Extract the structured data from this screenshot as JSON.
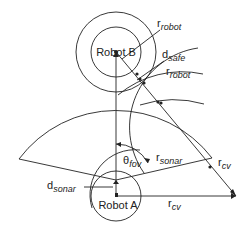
{
  "diagram": {
    "robots": {
      "a": {
        "label": "Robot A"
      },
      "b": {
        "label": "Robot B"
      }
    },
    "labels": {
      "r_robot_top": {
        "main": "r",
        "sub": "robot"
      },
      "d_safe": {
        "main": "d",
        "sub": "safe"
      },
      "r_robot_mid": {
        "main": "r",
        "sub": "robot"
      },
      "theta_fov": {
        "main": "θ",
        "sub": "fov"
      },
      "r_sonar": {
        "main": "r",
        "sub": "sonar"
      },
      "r_cv_diag": {
        "main": "r",
        "sub": "cv"
      },
      "d_sonar": {
        "main": "d",
        "sub": "sonar"
      },
      "r_cv_horiz": {
        "main": "r",
        "sub": "cv"
      }
    },
    "colors": {
      "stroke": "#222222",
      "background": "#ffffff"
    }
  }
}
